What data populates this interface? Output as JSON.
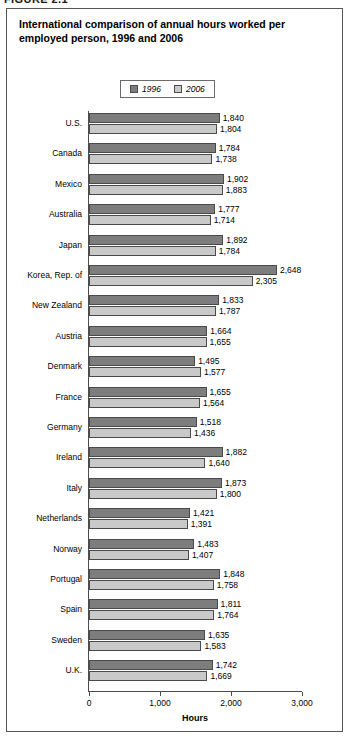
{
  "figure": {
    "label": "FIGURE 2.1"
  },
  "chart_title": "International comparison of annual hours worked per employed person, 1996 and 2006",
  "legend": {
    "position": "top-center",
    "entries": [
      {
        "name": "1996",
        "color": "#7d7d7d"
      },
      {
        "name": "2006",
        "color": "#c9c9c9"
      }
    ]
  },
  "axis": {
    "title": "Hours",
    "ticks": [
      "0",
      "1,000",
      "2,000",
      "3,000"
    ]
  },
  "chart_data": {
    "type": "bar",
    "orientation": "horizontal",
    "title": "International comparison of annual hours worked per employed person, 1996 and 2006",
    "xlabel": "Hours",
    "ylabel": "",
    "xlim": [
      0,
      3000
    ],
    "xticks": [
      0,
      1000,
      2000,
      3000
    ],
    "grid": false,
    "legend_position": "top-center",
    "categories": [
      "U.S.",
      "Canada",
      "Mexico",
      "Australia",
      "Japan",
      "Korea, Rep. of",
      "New Zealand",
      "Austria",
      "Denmark",
      "France",
      "Germany",
      "Ireland",
      "Italy",
      "Netherlands",
      "Norway",
      "Portugal",
      "Spain",
      "Sweden",
      "U.K."
    ],
    "series": [
      {
        "name": "1996",
        "color": "#7d7d7d",
        "values": [
          1840,
          1784,
          1902,
          1777,
          1892,
          2648,
          1833,
          1664,
          1495,
          1655,
          1518,
          1882,
          1873,
          1421,
          1483,
          1848,
          1811,
          1635,
          1742
        ],
        "labels": [
          "1,840",
          "1,784",
          "1,902",
          "1,777",
          "1,892",
          "2,648",
          "1,833",
          "1,664",
          "1,495",
          "1,655",
          "1,518",
          "1,882",
          "1,873",
          "1,421",
          "1,483",
          "1,848",
          "1,811",
          "1,635",
          "1,742"
        ]
      },
      {
        "name": "2006",
        "color": "#c9c9c9",
        "values": [
          1804,
          1738,
          1883,
          1714,
          1784,
          2305,
          1787,
          1655,
          1577,
          1564,
          1436,
          1640,
          1800,
          1391,
          1407,
          1758,
          1764,
          1583,
          1669
        ],
        "labels": [
          "1,804",
          "1,738",
          "1,883",
          "1,714",
          "1,784",
          "2,305",
          "1,787",
          "1,655",
          "1,577",
          "1,564",
          "1,436",
          "1,640",
          "1,800",
          "1,391",
          "1,407",
          "1,758",
          "1,764",
          "1,583",
          "1,669"
        ]
      }
    ]
  }
}
